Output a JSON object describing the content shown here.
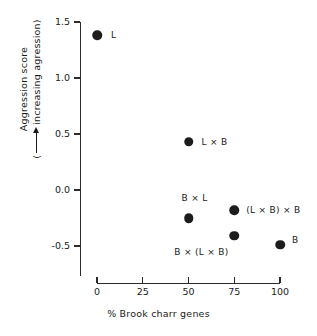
{
  "chart_data": {
    "type": "scatter",
    "title": "",
    "xlabel": "% Brook charr genes",
    "ylabel_line1": "Aggression score",
    "ylabel_line2_prefix": "(",
    "ylabel_line2_suffix": "increasing agression)",
    "xlim": [
      0,
      100
    ],
    "ylim": [
      -0.75,
      1.5
    ],
    "xticks": [
      0,
      25,
      50,
      75,
      100
    ],
    "xtick_labels": [
      "0",
      "25",
      "50",
      "75",
      "100"
    ],
    "yticks": [
      1.5,
      1.0,
      0.5,
      0.0,
      -0.5
    ],
    "ytick_labels": [
      "1.5",
      "1.0",
      "0.5",
      "0.0",
      "-0.5"
    ],
    "grid": false,
    "legend": "none",
    "marker": "filled-circle",
    "marker_color": "#1c1c1c",
    "axis_color": "#2b2b2b",
    "background": "#ffffff",
    "points": [
      {
        "label": "L",
        "x": 0,
        "y": 1.38,
        "label_dx": 14,
        "label_dy": -4
      },
      {
        "label": "L × B",
        "x": 50,
        "y": 0.43,
        "label_dx": 13,
        "label_dy": -4
      },
      {
        "label": "B × L",
        "x": 50,
        "y": -0.25,
        "label_dx": -7,
        "label_dy": -24
      },
      {
        "label": "(L × B) × B",
        "x": 75,
        "y": -0.18,
        "label_dx": 12,
        "label_dy": -4
      },
      {
        "label": "B × (L × B)",
        "x": 75,
        "y": -0.41,
        "label_dx": -60,
        "label_dy": 12
      },
      {
        "label": "B",
        "x": 100,
        "y": -0.49,
        "label_dx": 12,
        "label_dy": -9
      }
    ]
  }
}
